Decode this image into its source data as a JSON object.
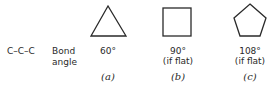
{
  "molecule": "C–C–C",
  "caption_line1": "Bond",
  "caption_line2": "angle",
  "shapes": [
    {
      "shape": "triangle",
      "angle": "60°",
      "note": "",
      "label": "(a)"
    },
    {
      "shape": "square",
      "angle": "90°",
      "note": "(if flat)",
      "label": "(b)"
    },
    {
      "shape": "pentagon",
      "angle": "108°",
      "note": "(if flat)",
      "label": "(c)"
    }
  ],
  "stroke_color": "#2a2a2a"
}
